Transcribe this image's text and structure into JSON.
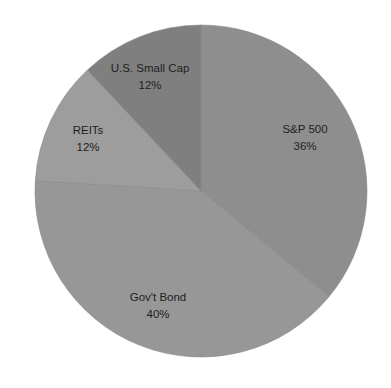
{
  "chart_data": {
    "type": "pie",
    "title": "",
    "start_angle_deg": 0,
    "direction": "clockwise",
    "legend": "none",
    "categories": [
      "S&P 500",
      "Gov't Bond",
      "REITs",
      "U.S. Small Cap"
    ],
    "values": [
      36,
      40,
      12,
      12
    ],
    "unit": "%",
    "slices": [
      {
        "label": "S&P 500",
        "value": 36,
        "value_label": "36%",
        "color": "#8e8e8e"
      },
      {
        "label": "Gov't Bond",
        "value": 40,
        "value_label": "40%",
        "color": "#979797"
      },
      {
        "label": "REITs",
        "value": 12,
        "value_label": "12%",
        "color": "#9d9d9d"
      },
      {
        "label": "U.S. Small Cap",
        "value": 12,
        "value_label": "12%",
        "color": "#7f7f7f"
      }
    ]
  }
}
